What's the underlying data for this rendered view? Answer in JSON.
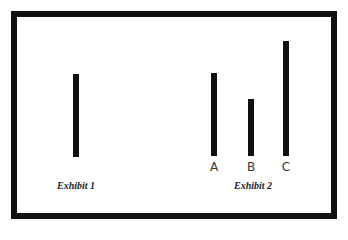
{
  "exhibit1": {
    "caption": "Exhibit 1",
    "bars": [
      {
        "label": "",
        "x": 73,
        "top": 74,
        "bottom": 157
      }
    ]
  },
  "exhibit2": {
    "caption": "Exhibit 2",
    "bars": [
      {
        "label": "A",
        "x": 211,
        "top": 73,
        "bottom": 156
      },
      {
        "label": "B",
        "x": 248,
        "top": 99,
        "bottom": 156
      },
      {
        "label": "C",
        "x": 283,
        "top": 41,
        "bottom": 156
      }
    ]
  },
  "colors": {
    "bar": "#111111",
    "frame": "#111111",
    "background": "#ffffff"
  }
}
